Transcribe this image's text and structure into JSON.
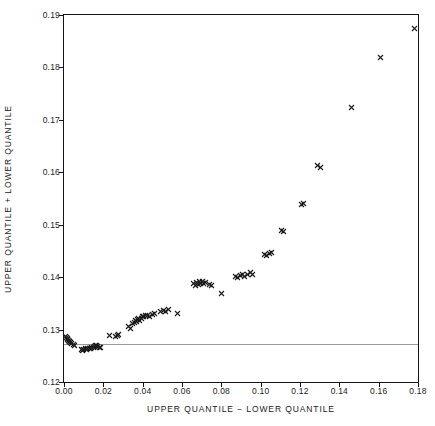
{
  "chart_data": {
    "type": "scatter",
    "title": "",
    "xlabel": "UPPER QUANTILE − LOWER QUANTILE",
    "ylabel": "UPPER QUANTILE + LOWER QUANTILE",
    "xlim": [
      0.0,
      0.18
    ],
    "ylim": [
      0.12,
      0.19
    ],
    "xticks": [
      0.0,
      0.02,
      0.04,
      0.06,
      0.08,
      0.1,
      0.12,
      0.14,
      0.16,
      0.18
    ],
    "xticklabels": [
      "0.00",
      "0.02",
      "0.04",
      "0.06",
      "0.08",
      "0.10",
      "0.12",
      "0.14",
      "0.16",
      "0.18"
    ],
    "yticks": [
      0.12,
      0.13,
      0.14,
      0.15,
      0.16,
      0.17,
      0.18,
      0.19
    ],
    "yticklabels": [
      "0.12",
      "0.13",
      "0.14",
      "0.15",
      "0.16",
      "0.17",
      "0.18",
      "0.19"
    ],
    "grid": false,
    "legend": null,
    "marker": "x",
    "marker_color": "#1b1b1b",
    "reference_lines": [
      {
        "orientation": "horizontal",
        "value": 0.1272,
        "color": "#9a9a9a"
      }
    ],
    "series": [
      {
        "name": "quantile pairs",
        "points": [
          [
            0.0008,
            0.1286
          ],
          [
            0.0012,
            0.1284
          ],
          [
            0.0016,
            0.1283
          ],
          [
            0.0019,
            0.1281
          ],
          [
            0.0022,
            0.1279
          ],
          [
            0.0026,
            0.1278
          ],
          [
            0.003,
            0.1277
          ],
          [
            0.0034,
            0.1276
          ],
          [
            0.004,
            0.1274
          ],
          [
            0.0046,
            0.1272
          ],
          [
            0.0052,
            0.127
          ],
          [
            0.0088,
            0.1262
          ],
          [
            0.0094,
            0.1261
          ],
          [
            0.0101,
            0.1262
          ],
          [
            0.0108,
            0.1263
          ],
          [
            0.0114,
            0.1262
          ],
          [
            0.0121,
            0.1263
          ],
          [
            0.0128,
            0.1264
          ],
          [
            0.0134,
            0.1264
          ],
          [
            0.0141,
            0.1265
          ],
          [
            0.0148,
            0.1266
          ],
          [
            0.0154,
            0.1268
          ],
          [
            0.016,
            0.1269
          ],
          [
            0.0166,
            0.127
          ],
          [
            0.0172,
            0.1268
          ],
          [
            0.0178,
            0.1266
          ],
          [
            0.0184,
            0.1265
          ],
          [
            0.0232,
            0.1288
          ],
          [
            0.0262,
            0.1287
          ],
          [
            0.0272,
            0.1289
          ],
          [
            0.0278,
            0.129
          ],
          [
            0.033,
            0.1306
          ],
          [
            0.0338,
            0.1303
          ],
          [
            0.0348,
            0.1311
          ],
          [
            0.0356,
            0.1314
          ],
          [
            0.0362,
            0.1317
          ],
          [
            0.0368,
            0.1315
          ],
          [
            0.0374,
            0.1319
          ],
          [
            0.038,
            0.1321
          ],
          [
            0.0386,
            0.1318
          ],
          [
            0.0392,
            0.1322
          ],
          [
            0.0398,
            0.1325
          ],
          [
            0.0406,
            0.1324
          ],
          [
            0.0414,
            0.1326
          ],
          [
            0.0424,
            0.1327
          ],
          [
            0.0436,
            0.1324
          ],
          [
            0.0448,
            0.1328
          ],
          [
            0.0462,
            0.133
          ],
          [
            0.0492,
            0.1334
          ],
          [
            0.0504,
            0.1336
          ],
          [
            0.0516,
            0.1335
          ],
          [
            0.053,
            0.1338
          ],
          [
            0.0578,
            0.133
          ],
          [
            0.066,
            0.1388
          ],
          [
            0.0668,
            0.1385
          ],
          [
            0.0676,
            0.139
          ],
          [
            0.0682,
            0.1386
          ],
          [
            0.0688,
            0.1391
          ],
          [
            0.0694,
            0.1388
          ],
          [
            0.0702,
            0.1392
          ],
          [
            0.071,
            0.1387
          ],
          [
            0.0718,
            0.139
          ],
          [
            0.0738,
            0.1386
          ],
          [
            0.0752,
            0.1384
          ],
          [
            0.08,
            0.1368
          ],
          [
            0.0872,
            0.1402
          ],
          [
            0.0884,
            0.14
          ],
          [
            0.0896,
            0.1403
          ],
          [
            0.0908,
            0.1405
          ],
          [
            0.092,
            0.1402
          ],
          [
            0.0932,
            0.1406
          ],
          [
            0.0946,
            0.1408
          ],
          [
            0.0958,
            0.1405
          ],
          [
            0.1018,
            0.1443
          ],
          [
            0.103,
            0.1442
          ],
          [
            0.1044,
            0.1445
          ],
          [
            0.1056,
            0.1447
          ],
          [
            0.1104,
            0.1489
          ],
          [
            0.1116,
            0.1487
          ],
          [
            0.1208,
            0.1539
          ],
          [
            0.122,
            0.1541
          ],
          [
            0.129,
            0.1612
          ],
          [
            0.1302,
            0.161
          ],
          [
            0.146,
            0.1723
          ],
          [
            0.161,
            0.1818
          ],
          [
            0.1782,
            0.1875
          ]
        ]
      }
    ]
  }
}
